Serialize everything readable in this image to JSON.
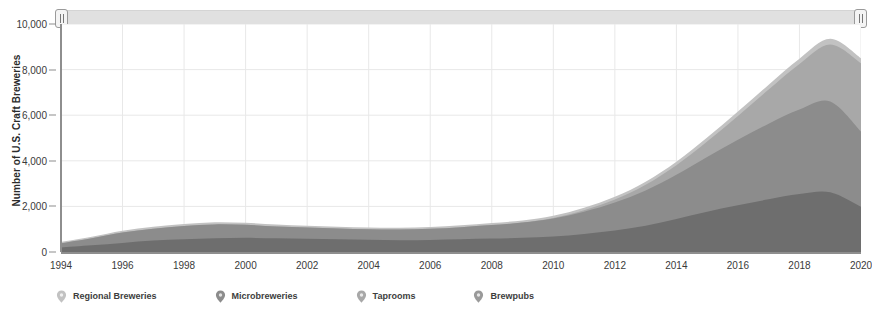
{
  "chart_data": {
    "type": "area",
    "title": "",
    "subtitle": "",
    "xlabel": "",
    "ylabel": "Number of U.S. Craft Breweries",
    "stacked": true,
    "grid": true,
    "legend_position": "bottom",
    "xlim": [
      1994,
      2020
    ],
    "ylim": [
      0,
      10000
    ],
    "x_tick_labels": [
      "1994",
      "1996",
      "1998",
      "2000",
      "2002",
      "2004",
      "2006",
      "2008",
      "2010",
      "2012",
      "2014",
      "2016",
      "2018",
      "2020"
    ],
    "y_tick_labels": [
      "0",
      "2,000",
      "4,000",
      "6,000",
      "8,000",
      "10,000"
    ],
    "y_tick_values": [
      0,
      2000,
      4000,
      6000,
      8000,
      10000
    ],
    "x": [
      1994,
      1995,
      1996,
      1997,
      1998,
      1999,
      2000,
      2001,
      2002,
      2003,
      2004,
      2005,
      2006,
      2007,
      2008,
      2009,
      2010,
      2011,
      2012,
      2013,
      2014,
      2015,
      2016,
      2017,
      2018,
      2019,
      2020
    ],
    "series": [
      {
        "name": "Brewpubs",
        "color": "#6e6e6e",
        "values": [
          200,
          300,
          400,
          500,
          560,
          600,
          620,
          600,
          580,
          560,
          540,
          520,
          530,
          560,
          590,
          620,
          680,
          790,
          940,
          1150,
          1450,
          1770,
          2050,
          2310,
          2540,
          2620,
          1980
        ]
      },
      {
        "name": "Microbreweries",
        "color": "#8c8c8c",
        "values": [
          180,
          300,
          450,
          520,
          580,
          610,
          570,
          520,
          490,
          470,
          460,
          470,
          490,
          530,
          590,
          670,
          790,
          980,
          1230,
          1550,
          1940,
          2400,
          2870,
          3320,
          3710,
          3980,
          3300
        ]
      },
      {
        "name": "Taprooms",
        "color": "#a8a8a8",
        "values": [
          0,
          0,
          0,
          0,
          0,
          0,
          0,
          0,
          0,
          0,
          0,
          0,
          0,
          0,
          0,
          0,
          20,
          60,
          130,
          250,
          420,
          680,
          1050,
          1500,
          2000,
          2500,
          3000
        ]
      },
      {
        "name": "Regional Breweries",
        "color": "#c2c2c2",
        "values": [
          60,
          70,
          80,
          85,
          90,
          95,
          90,
          85,
          80,
          78,
          76,
          78,
          80,
          85,
          90,
          95,
          100,
          110,
          120,
          135,
          150,
          170,
          190,
          210,
          230,
          250,
          220
        ]
      }
    ],
    "totals": [
      440,
      670,
      930,
      1105,
      1230,
      1305,
      1280,
      1205,
      1150,
      1108,
      1076,
      1068,
      1100,
      1175,
      1270,
      1385,
      1590,
      1940,
      2420,
      3085,
      3960,
      5020,
      6160,
      7340,
      8480,
      9350,
      8500
    ],
    "annotations": []
  },
  "legend": {
    "items": [
      {
        "label": "Regional Breweries",
        "color": "#c2c2c2",
        "marker": "balloon-marker-icon"
      },
      {
        "label": "Microbreweries",
        "color": "#8c8c8c",
        "marker": "balloon-marker-icon"
      },
      {
        "label": "Taprooms",
        "color": "#a8a8a8",
        "marker": "balloon-marker-icon"
      },
      {
        "label": "Brewpubs",
        "color": "#9a9a9a",
        "marker": "balloon-marker-icon"
      }
    ]
  },
  "range_slider": {
    "left_handle_label": "",
    "right_handle_label": "",
    "track_color": "#e0e0e0"
  },
  "colors": {
    "grid": "#e8e8e8",
    "axis": "#8e8e8e",
    "plot_background": "#ffffff",
    "text": "#333333"
  }
}
